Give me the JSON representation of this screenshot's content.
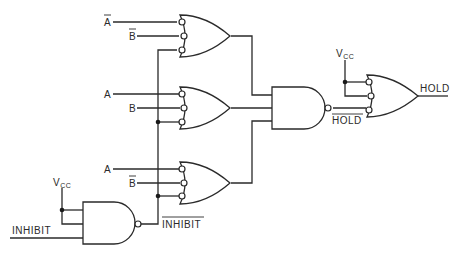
{
  "diagram": {
    "type": "logic-circuit",
    "labels": {
      "or1_in1": "A",
      "or1_in1_inverted": true,
      "or1_in2": "B",
      "or1_in2_inverted": true,
      "or2_in1": "A",
      "or2_in2": "B",
      "or3_in1": "A",
      "or3_in2": "B",
      "or3_in2_inverted": true,
      "vcc_left": "V",
      "vcc_left_sub": "CC",
      "vcc_right": "V",
      "vcc_right_sub": "CC",
      "inhibit_in": "INHIBIT",
      "inhibit_out": "INHIBIT",
      "hold_bar": "HOLD",
      "hold_out": "HOLD"
    },
    "gates": [
      {
        "id": "or1",
        "kind": "OR",
        "inputs": 3,
        "inverted_inputs": true
      },
      {
        "id": "or2",
        "kind": "OR",
        "inputs": 3,
        "inverted_inputs": true
      },
      {
        "id": "or3",
        "kind": "OR",
        "inputs": 3,
        "inverted_inputs": true
      },
      {
        "id": "nand_inhibit",
        "kind": "NAND",
        "inputs": 3
      },
      {
        "id": "nand_hold",
        "kind": "NAND",
        "inputs": 3
      },
      {
        "id": "or_out",
        "kind": "OR",
        "inputs": 3,
        "inverted_inputs": true
      }
    ]
  }
}
